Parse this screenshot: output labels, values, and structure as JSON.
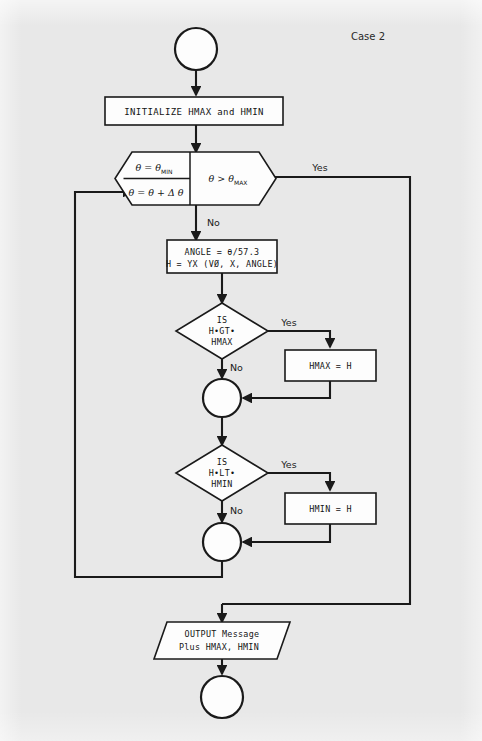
{
  "page": {
    "caption": "Case 2",
    "background_color": "#e8e8e8",
    "ink_color": "#1a1a1a"
  },
  "diagram": {
    "type": "flowchart",
    "title": "Case 2",
    "nodes": {
      "start": {
        "shape": "circle",
        "label": ""
      },
      "initialize": {
        "shape": "process",
        "label": "INITIALIZE HMAX and HMIN"
      },
      "loop": {
        "shape": "hexagon-loop",
        "init_label": "θ = θ",
        "init_sub": "MIN",
        "increment_label": "θ = θ + Δ θ",
        "test_label": "θ > θ",
        "test_sub": "MAX"
      },
      "compute": {
        "shape": "process",
        "line1": "ANGLE = θ/57.3",
        "line2": "H = YX (VØ, X, ANGLE)"
      },
      "decision_max": {
        "shape": "decision",
        "line1": "IS",
        "line2": "H•GT•",
        "line3": "HMAX"
      },
      "assign_max": {
        "shape": "process",
        "label": "HMAX = H"
      },
      "junction_max": {
        "shape": "connector",
        "label": ""
      },
      "decision_min": {
        "shape": "decision",
        "line1": "IS",
        "line2": "H•LT•",
        "line3": "HMIN"
      },
      "assign_min": {
        "shape": "process",
        "label": "HMIN = H"
      },
      "junction_min": {
        "shape": "connector",
        "label": ""
      },
      "output": {
        "shape": "parallelogram",
        "line1": "OUTPUT Message",
        "line2": "Plus HMAX, HMIN"
      },
      "end": {
        "shape": "circle",
        "label": ""
      }
    },
    "edge_labels": {
      "loop_yes": "Yes",
      "loop_no": "No",
      "max_yes": "Yes",
      "max_no": "No",
      "min_yes": "Yes",
      "min_no": "No"
    }
  }
}
